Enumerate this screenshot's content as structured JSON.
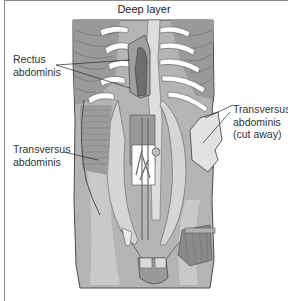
{
  "diagram": {
    "title": "Deep layer",
    "labels": [
      {
        "id": "rectus",
        "line1": "Rectus",
        "line2": "abdominis"
      },
      {
        "id": "transversus-left",
        "line1": "Transversus",
        "line2": "abdominis"
      },
      {
        "id": "transversus-cut",
        "line1": "Transversus",
        "line2": "abdominis",
        "line3": "(cut away)"
      }
    ],
    "colors": {
      "frame_border": "#8a8a8a",
      "muscle_dark": "#8c8c8c",
      "muscle_mid": "#a8a8a8",
      "muscle_light": "#c8c8c8",
      "bone": "#ffffff",
      "outline": "#4a4a4a"
    }
  }
}
